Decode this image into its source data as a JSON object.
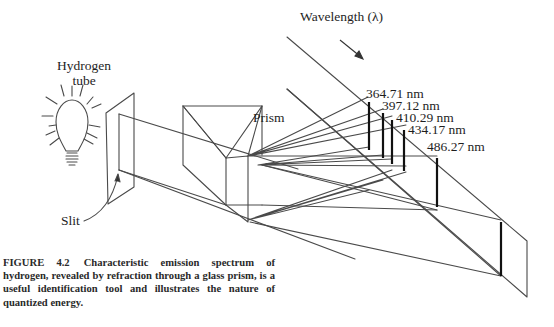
{
  "figure": {
    "labels": {
      "source_line1": "Hydrogen",
      "source_line2": "tube",
      "prism": "Prism",
      "slit": "Slit",
      "wavelength": "Wavelength (λ)"
    },
    "spectral_lines": [
      {
        "label": "364.71 nm",
        "value_nm": 364.71
      },
      {
        "label": "397.12 nm",
        "value_nm": 397.12
      },
      {
        "label": "410.29 nm",
        "value_nm": 410.29
      },
      {
        "label": "434.17 nm",
        "value_nm": 434.17
      },
      {
        "label": "486.27 nm",
        "value_nm": 486.27
      }
    ],
    "icons": [
      "light-bulb-icon",
      "arrow-icon"
    ],
    "colors": {
      "line": "#4a4a4a",
      "spectral_line": "#111111",
      "text": "#1e1e1e"
    }
  },
  "caption": {
    "number": "FIGURE 4.2",
    "text": "Characteristic emission spectrum of hydrogen, revealed by refraction through a glass prism, is a useful identification tool and illustrates the nature of quantized energy."
  }
}
